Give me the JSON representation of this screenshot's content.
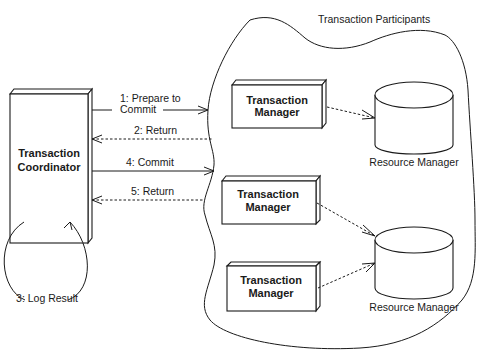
{
  "diagram": {
    "region_label": "Transaction Participants",
    "coordinator": {
      "line1": "Transaction",
      "line2": "Coordinator"
    },
    "managers": [
      {
        "line1": "Transaction",
        "line2": "Manager"
      },
      {
        "line1": "Transaction",
        "line2": "Manager"
      },
      {
        "line1": "Transaction",
        "line2": "Manager"
      }
    ],
    "resources": [
      {
        "label": "Resource Manager"
      },
      {
        "label": "Resource Manager"
      }
    ],
    "messages": [
      {
        "line1": "1: Prepare to",
        "line2": "Commit",
        "style": "solid",
        "direction": "to-participants"
      },
      {
        "label": "2: Return",
        "style": "dashed",
        "direction": "to-coordinator"
      },
      {
        "label": "3: Log Result",
        "style": "solid",
        "direction": "self-loop"
      },
      {
        "label": "4: Commit",
        "style": "solid",
        "direction": "to-participants"
      },
      {
        "label": "5: Return",
        "style": "dashed",
        "direction": "to-coordinator"
      }
    ],
    "colors": {
      "stroke": "#1a1a1a",
      "background": "#ffffff"
    }
  }
}
